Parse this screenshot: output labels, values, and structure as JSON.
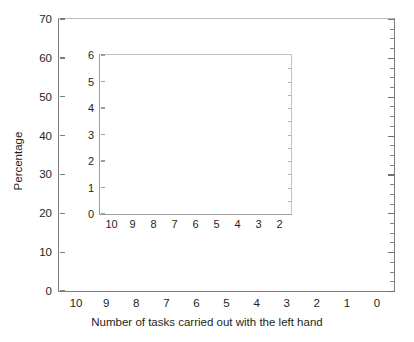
{
  "chart_data": {
    "type": "bar",
    "title": "",
    "xlabel": "Number of tasks carried out with the left hand",
    "ylabel": "Percentage",
    "stacked": true,
    "grid": false,
    "legend": "none",
    "categories": [
      "10",
      "9",
      "8",
      "7",
      "6",
      "5",
      "4",
      "3",
      "2",
      "1",
      "0"
    ],
    "ylim": [
      0,
      70
    ],
    "yticks": [
      0,
      10,
      20,
      30,
      40,
      50,
      60,
      70
    ],
    "series": [
      {
        "name": "light",
        "color": "#d2d2d2",
        "values": [
          1.6,
          1.3,
          0.8,
          0.75,
          0.6,
          0.85,
          0.95,
          1.6,
          2.9,
          8.5,
          28.0
        ]
      },
      {
        "name": "dark",
        "color": "#231f20",
        "values": [
          1.4,
          0.9,
          0.65,
          0.55,
          0.35,
          0.45,
          0.85,
          1.2,
          2.7,
          9.0,
          33.5
        ]
      }
    ],
    "totals": [
      3.0,
      2.2,
      1.45,
      1.3,
      0.95,
      1.3,
      1.8,
      2.8,
      5.6,
      17.5,
      61.5
    ],
    "inset": {
      "type": "bar",
      "stacked": true,
      "categories": [
        "10",
        "9",
        "8",
        "7",
        "6",
        "5",
        "4",
        "3",
        "2"
      ],
      "ylim": [
        0,
        6
      ],
      "yticks": [
        0,
        1,
        2,
        3,
        4,
        5,
        6
      ],
      "xlabel": "",
      "ylabel": "",
      "series": [
        {
          "name": "light",
          "color": "#d2d2d2",
          "values": [
            1.6,
            1.3,
            0.8,
            0.75,
            0.6,
            0.85,
            0.95,
            1.6,
            2.9
          ]
        },
        {
          "name": "dark",
          "color": "#231f20",
          "values": [
            1.4,
            0.9,
            0.65,
            0.55,
            0.35,
            0.45,
            0.85,
            1.2,
            2.7
          ]
        }
      ],
      "totals": [
        3.0,
        2.2,
        1.45,
        1.3,
        0.95,
        1.3,
        1.8,
        2.8,
        5.6
      ]
    }
  }
}
